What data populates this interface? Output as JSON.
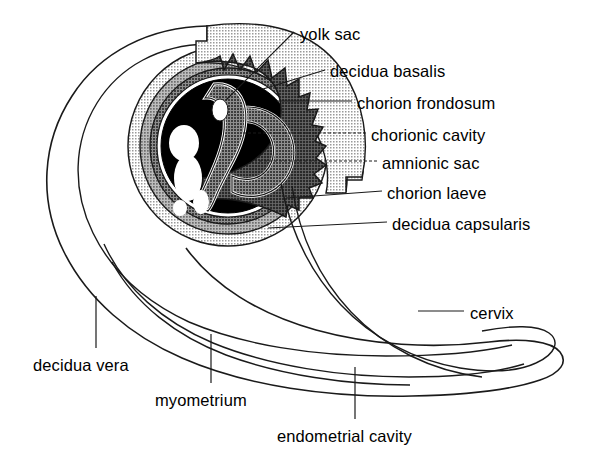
{
  "figure": {
    "type": "anatomical-line-diagram",
    "background_color": "#ffffff",
    "stroke_color": "#1a1a1a"
  },
  "palette": {
    "outline": "#1a1a1a",
    "white": "#ffffff",
    "decidua_vera_fill": "#d9d9d9",
    "decidua_basalis_fill": "#a8a8a8",
    "decidua_capsularis_fill": "#c4c4c4",
    "chorion_laeve_fill": "#8c8c8c",
    "amnion_fill": "#6e6e6e",
    "chorionic_cavity_fill": "#000000",
    "embryo_fill": "#ffffff"
  },
  "labels": [
    {
      "id": "yolk-sac",
      "text": "yolk sac",
      "x": 300,
      "y": 26
    },
    {
      "id": "decidua-basalis",
      "text": "decidua basalis",
      "x": 330,
      "y": 63
    },
    {
      "id": "chorion-frondosum",
      "text": "chorion frondosum",
      "x": 357,
      "y": 95
    },
    {
      "id": "chorionic-cavity",
      "text": "chorionic cavity",
      "x": 371,
      "y": 127
    },
    {
      "id": "amnionic-sac",
      "text": "amnionic sac",
      "x": 382,
      "y": 155
    },
    {
      "id": "chorion-laeve",
      "text": "chorion laeve",
      "x": 387,
      "y": 185
    },
    {
      "id": "decidua-capsularis",
      "text": "decidua capsularis",
      "x": 392,
      "y": 216
    },
    {
      "id": "cervix",
      "text": "cervix",
      "x": 470,
      "y": 305
    },
    {
      "id": "decidua-vera",
      "text": "decidua vera",
      "x": 33,
      "y": 357
    },
    {
      "id": "myometrium",
      "text": "myometrium",
      "x": 155,
      "y": 392
    },
    {
      "id": "endometrial-cavity",
      "text": "endometrial cavity",
      "x": 277,
      "y": 428
    }
  ],
  "structures": [
    {
      "id": "uterus-outer-wall",
      "name": "myometrium outer contour"
    },
    {
      "id": "endometrial-cavity",
      "name": "endometrial cavity lumen"
    },
    {
      "id": "decidua-vera",
      "name": "decidua vera (parietalis) layer"
    },
    {
      "id": "gestational-sac",
      "name": "gestational sac concentric rings"
    },
    {
      "id": "decidua-basalis",
      "name": "decidua basalis wedge"
    },
    {
      "id": "chorion-frondosum",
      "name": "chorion frondosum villi (sawtooth)"
    },
    {
      "id": "chorion-laeve",
      "name": "chorion laeve smooth ring"
    },
    {
      "id": "decidua-capsularis",
      "name": "decidua capsularis ring"
    },
    {
      "id": "chorionic-cavity",
      "name": "chorionic cavity (dark)"
    },
    {
      "id": "amnionic-sac",
      "name": "amnionic sac"
    },
    {
      "id": "embryo",
      "name": "embryo with limb buds"
    },
    {
      "id": "yolk-sac",
      "name": "yolk sac vesicle"
    },
    {
      "id": "cervix",
      "name": "cervical canal"
    }
  ]
}
